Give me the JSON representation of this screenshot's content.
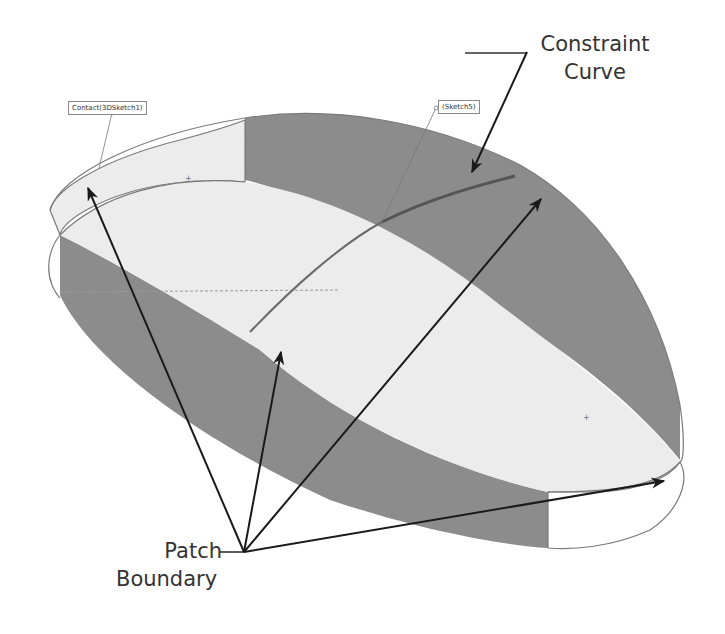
{
  "figure": {
    "tags": {
      "contact": "Contact(3DSketch1)",
      "sketch": "(Sketch5)"
    },
    "callouts": {
      "constraint_curve": {
        "line1": "Constraint",
        "line2": "Curve"
      },
      "patch_boundary": {
        "line1": "Patch",
        "line2": "Boundary"
      }
    },
    "colors": {
      "light_face": "#ececec",
      "dark_face": "#8c8c8c",
      "edge": "#7a7a7a",
      "arrow": "#1a1a1a",
      "text": "#333333"
    }
  }
}
